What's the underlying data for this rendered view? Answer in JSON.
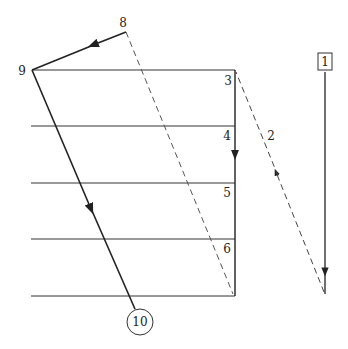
{
  "diagram": {
    "labels": {
      "p1": "1",
      "p2": "2",
      "p3": "3",
      "p4": "4",
      "p5": "5",
      "p6": "6",
      "p8": "8",
      "p9": "9",
      "p10": "10"
    },
    "colors": {
      "line": "#222222",
      "layer": "#333333",
      "background": "#ffffff"
    },
    "layers": [
      70,
      126,
      183,
      239,
      296
    ]
  }
}
